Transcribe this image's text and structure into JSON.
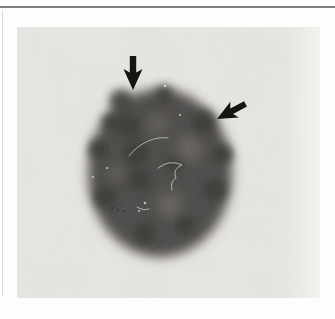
{
  "figure": {
    "kind": "micrograph",
    "label": "Dark-stained round cell nucleus on a light photographic background, with two black arrows pointing to dark peripheral granules",
    "colors": {
      "page_bg": "#fdfdfd",
      "rule_top": "#787878",
      "rule_left": "#cbcbcb",
      "photo_bg": "#e9e7e3",
      "cell_body": "#4d4b48",
      "patch": "#393734",
      "light_spot": "#807d78",
      "scratch": "#d8d6d1",
      "speck_light": "#e4e2dd",
      "speck_dark": "#32302e",
      "arrow": "#161514"
    },
    "photo": {
      "x": 17,
      "y": 27,
      "width": 303,
      "height": 271
    },
    "cell": {
      "cx": 143,
      "cy": 146,
      "rx": 72,
      "ry": 84,
      "patches": [
        {
          "cx": 104,
          "cy": 74,
          "r": 12
        },
        {
          "cx": 147,
          "cy": 67,
          "r": 9
        },
        {
          "cx": 187,
          "cy": 95,
          "r": 12
        },
        {
          "cx": 206,
          "cy": 127,
          "r": 10
        },
        {
          "cx": 198,
          "cy": 163,
          "r": 11
        },
        {
          "cx": 81,
          "cy": 122,
          "r": 10
        },
        {
          "cx": 88,
          "cy": 170,
          "r": 11
        },
        {
          "cx": 128,
          "cy": 206,
          "r": 11
        },
        {
          "cx": 168,
          "cy": 198,
          "r": 10
        },
        {
          "cx": 119,
          "cy": 126,
          "r": 13
        },
        {
          "cx": 123,
          "cy": 153,
          "r": 11
        },
        {
          "cx": 112,
          "cy": 99,
          "r": 11
        },
        {
          "cx": 158,
          "cy": 137,
          "r": 9
        },
        {
          "cx": 94,
          "cy": 95,
          "r": 9
        }
      ],
      "light_spots": [
        {
          "cx": 172,
          "cy": 122,
          "r": 13
        },
        {
          "cx": 141,
          "cy": 97,
          "r": 9
        },
        {
          "cx": 153,
          "cy": 178,
          "r": 12
        },
        {
          "cx": 99,
          "cy": 146,
          "r": 7
        }
      ],
      "scratches": [
        {
          "d": "M112,129 C122,116 138,109 151,111"
        },
        {
          "d": "M141,141 q12,-9 24,-3 q-10,4 -6,13 q-6,3 -4,12"
        },
        {
          "d": "M120,180 q6,4 12,2"
        }
      ],
      "specks_light": [
        {
          "x": 128,
          "y": 176
        },
        {
          "x": 122,
          "y": 184
        },
        {
          "x": 90,
          "y": 141
        },
        {
          "x": 148,
          "y": 59
        },
        {
          "x": 163,
          "y": 88
        },
        {
          "x": 76,
          "y": 150
        }
      ],
      "specks_dark": [
        {
          "x": 95,
          "y": 181
        },
        {
          "x": 101,
          "y": 183
        },
        {
          "x": 107,
          "y": 184
        }
      ]
    },
    "arrows": [
      {
        "name": "top-arrow",
        "direction": "down",
        "transform": "translate(116,63)"
      },
      {
        "name": "right-arrow",
        "direction": "down-left",
        "transform": "translate(200,92) rotate(62) scale(0.95)"
      }
    ]
  }
}
